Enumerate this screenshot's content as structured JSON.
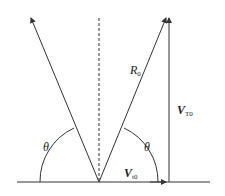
{
  "diagram": {
    "labels": {
      "r0_main": "R",
      "r0_sub": "0",
      "vertical_main": "V",
      "vertical_sub": "T0",
      "horizontal_main": "V",
      "horizontal_sub": "t0",
      "theta_left": "θ",
      "theta_right": "θ"
    },
    "colors": {
      "stroke": "#333333",
      "background": "#ffffff"
    }
  }
}
